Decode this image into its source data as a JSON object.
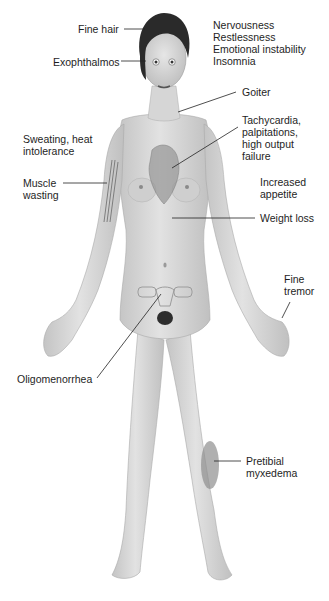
{
  "figure": {
    "topic": "clinical manifestations of hyperthyroidism"
  },
  "labels": {
    "fine_hair": "Fine hair",
    "exophthalmos": "Exophthalmos",
    "nervous": [
      "Nervousness",
      "Restlessness",
      "Emotional instability",
      "Insomnia"
    ],
    "goiter": "Goiter",
    "cardiac": [
      "Tachycardia,",
      "palpitations,",
      "high output",
      "failure"
    ],
    "sweating": [
      "Sweating, heat",
      "intolerance"
    ],
    "muscle": [
      "Muscle",
      "wasting"
    ],
    "appetite": [
      "Increased",
      "appetite"
    ],
    "weight_loss": "Weight loss",
    "tremor": [
      "Fine",
      "tremor"
    ],
    "oligomenorrhea": "Oligomenorrhea",
    "pretibial": [
      "Pretibial",
      "myxedema"
    ]
  },
  "colors": {
    "skin": "#dcdcdc",
    "skin_shadow": "#b9b9b9",
    "hair": "#2a2a2a",
    "leader_line": "#222222",
    "text": "#1e1e1e"
  }
}
